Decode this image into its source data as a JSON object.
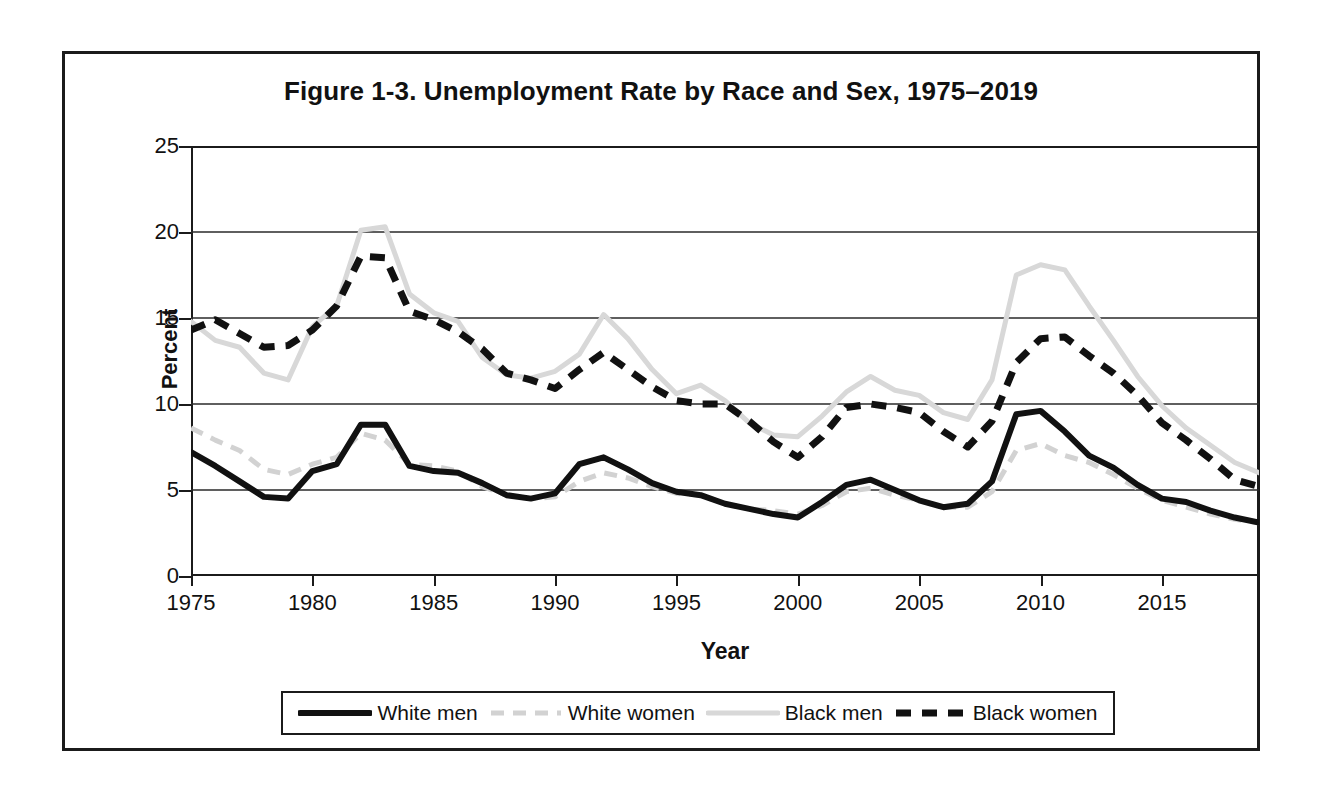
{
  "chart_data": {
    "type": "line",
    "title": "Figure 1-3. Unemployment Rate by Race and Sex, 1975–2019",
    "xlabel": "Year",
    "ylabel": "Percent",
    "ylim": [
      0,
      25
    ],
    "yticks": [
      0,
      5,
      10,
      15,
      20,
      25
    ],
    "xlim": [
      1975,
      2019
    ],
    "xticks": [
      1975,
      1980,
      1985,
      1990,
      1995,
      2000,
      2005,
      2010,
      2015
    ],
    "grid": "horizontal",
    "legend_position": "bottom",
    "x": [
      1975,
      1976,
      1977,
      1978,
      1979,
      1980,
      1981,
      1982,
      1983,
      1984,
      1985,
      1986,
      1987,
      1988,
      1989,
      1990,
      1991,
      1992,
      1993,
      1994,
      1995,
      1996,
      1997,
      1998,
      1999,
      2000,
      2001,
      2002,
      2003,
      2004,
      2005,
      2006,
      2007,
      2008,
      2009,
      2010,
      2011,
      2012,
      2013,
      2014,
      2015,
      2016,
      2017,
      2018,
      2019
    ],
    "series": [
      {
        "name": "White men",
        "color": "#111111",
        "style": "solid-thick",
        "values": [
          7.2,
          6.4,
          5.5,
          4.6,
          4.5,
          6.1,
          6.5,
          8.8,
          8.8,
          6.4,
          6.1,
          6.0,
          5.4,
          4.7,
          4.5,
          4.8,
          6.5,
          6.9,
          6.2,
          5.4,
          4.9,
          4.7,
          4.2,
          3.9,
          3.6,
          3.4,
          4.3,
          5.3,
          5.6,
          5.0,
          4.4,
          4.0,
          4.2,
          5.5,
          9.4,
          9.6,
          8.4,
          7.0,
          6.3,
          5.3,
          4.5,
          4.3,
          3.8,
          3.4,
          3.1
        ]
      },
      {
        "name": "White women",
        "color": "#d2d2d2",
        "style": "dashed-light",
        "values": [
          8.6,
          7.9,
          7.3,
          6.2,
          5.9,
          6.5,
          6.9,
          8.3,
          7.9,
          6.5,
          6.4,
          6.1,
          5.2,
          4.7,
          4.5,
          4.6,
          5.5,
          6.0,
          5.7,
          5.2,
          4.8,
          4.7,
          4.2,
          3.9,
          3.8,
          3.6,
          4.1,
          4.9,
          5.1,
          4.7,
          4.4,
          4.0,
          4.0,
          4.9,
          7.3,
          7.7,
          7.0,
          6.6,
          5.9,
          5.1,
          4.4,
          4.0,
          3.6,
          3.3,
          3.1
        ]
      },
      {
        "name": "Black men",
        "color": "#d8d8d8",
        "style": "solid-light",
        "values": [
          14.8,
          13.7,
          13.3,
          11.8,
          11.4,
          14.5,
          15.7,
          20.1,
          20.3,
          16.4,
          15.3,
          14.8,
          12.7,
          11.7,
          11.5,
          11.9,
          12.9,
          15.2,
          13.8,
          12.0,
          10.6,
          11.1,
          10.2,
          8.9,
          8.2,
          8.1,
          9.3,
          10.7,
          11.6,
          10.8,
          10.5,
          9.5,
          9.1,
          11.4,
          17.5,
          18.1,
          17.8,
          15.7,
          13.7,
          11.6,
          9.9,
          8.6,
          7.6,
          6.6,
          6.0
        ]
      },
      {
        "name": "Black women",
        "color": "#111111",
        "style": "dashed-bold",
        "values": [
          14.3,
          14.9,
          14.1,
          13.3,
          13.4,
          14.3,
          15.7,
          18.6,
          18.5,
          15.4,
          14.9,
          14.2,
          13.2,
          11.8,
          11.4,
          10.9,
          12.0,
          13.0,
          12.0,
          11.0,
          10.2,
          10.0,
          10.0,
          9.0,
          7.8,
          6.9,
          8.1,
          9.8,
          10.0,
          9.8,
          9.5,
          8.4,
          7.5,
          9.0,
          12.4,
          13.8,
          13.9,
          12.8,
          11.8,
          10.5,
          8.9,
          7.9,
          6.8,
          5.6,
          5.2
        ]
      }
    ]
  },
  "axis": {
    "y_tick_labels": [
      "0",
      "5",
      "10",
      "15",
      "20",
      "25"
    ],
    "x_tick_labels": [
      "1975",
      "1980",
      "1985",
      "1990",
      "1995",
      "2000",
      "2005",
      "2010",
      "2015"
    ],
    "y_title": "Percent",
    "x_title": "Year"
  },
  "legend": {
    "items": [
      {
        "label": "White men",
        "swatch": "solid-thick-black-line-icon"
      },
      {
        "label": "White women",
        "swatch": "dashed-light-gray-line-icon"
      },
      {
        "label": "Black men",
        "swatch": "solid-light-gray-line-icon"
      },
      {
        "label": "Black women",
        "swatch": "dashed-bold-black-line-icon"
      }
    ]
  }
}
